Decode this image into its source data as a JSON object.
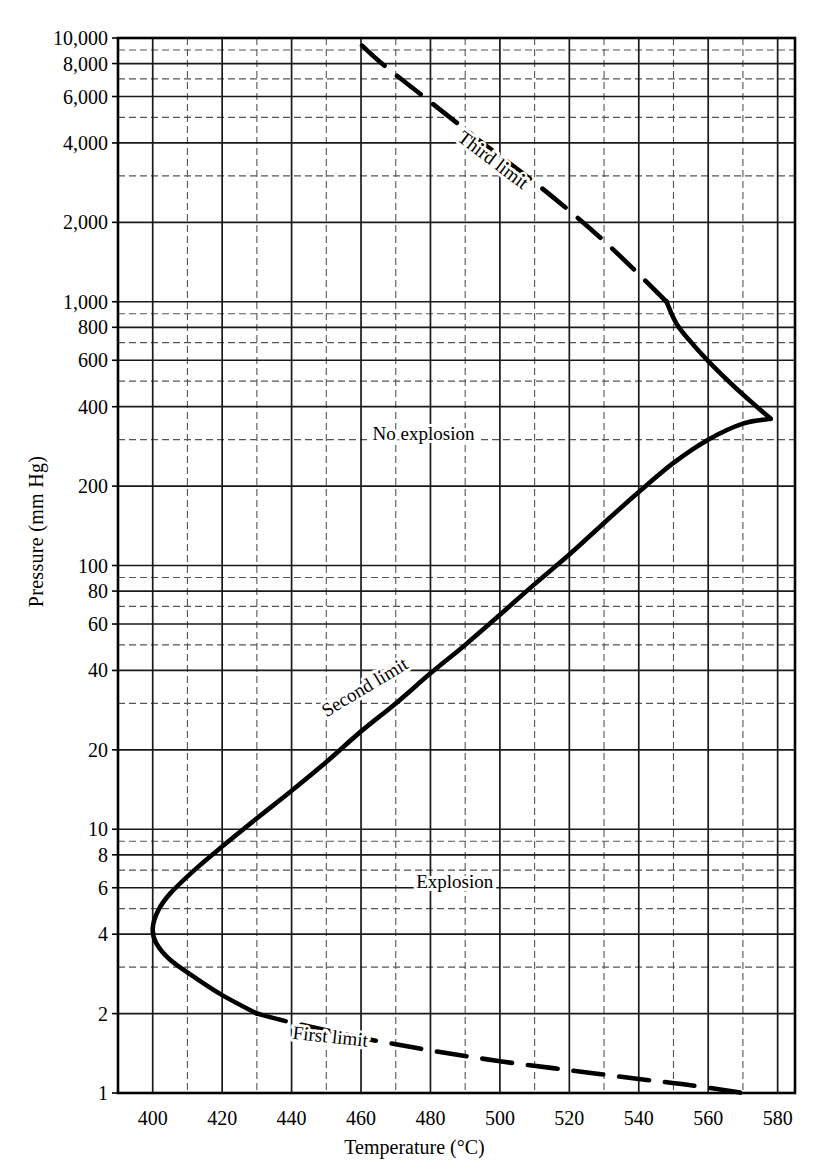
{
  "chart_data": {
    "type": "line",
    "title": "",
    "xlabel": "Temperature (°C)",
    "ylabel": "Pressure (mm Hg)",
    "xlim": [
      390,
      585
    ],
    "ylim": [
      1,
      10000
    ],
    "yscale": "log",
    "xscale": "linear",
    "grid": true,
    "legend": "none",
    "x_ticks": [
      400,
      420,
      440,
      460,
      480,
      500,
      520,
      540,
      560,
      580
    ],
    "x_tick_labels": [
      "400",
      "420",
      "440",
      "460",
      "480",
      "500",
      "520",
      "540",
      "560",
      "580"
    ],
    "x_minor_ticks": [
      410,
      430,
      450,
      470,
      490,
      510,
      530,
      550,
      570
    ],
    "y_ticks": [
      1,
      2,
      4,
      6,
      8,
      10,
      20,
      40,
      60,
      80,
      100,
      200,
      400,
      600,
      800,
      1000,
      2000,
      4000,
      6000,
      8000,
      10000
    ],
    "y_tick_labels": [
      "1",
      "2",
      "4",
      "6",
      "8",
      "10",
      "20",
      "40",
      "60",
      "80",
      "100",
      "200",
      "400",
      "600",
      "800",
      "1,000",
      "2,000",
      "4,000",
      "6,000",
      "8,000",
      "10,000"
    ],
    "y_minor_ticks": [
      3,
      5,
      7,
      9,
      30,
      50,
      70,
      90,
      300,
      500,
      700,
      900,
      3000,
      5000,
      7000,
      9000
    ],
    "series": [
      {
        "name": "First limit",
        "style": "dashed",
        "label": "First limit",
        "points": [
          [
            430.0,
            2.0
          ],
          [
            440.0,
            1.85
          ],
          [
            460.0,
            1.62
          ],
          [
            480.0,
            1.45
          ],
          [
            500.0,
            1.32
          ],
          [
            520.0,
            1.22
          ],
          [
            540.0,
            1.13
          ],
          [
            555.0,
            1.07
          ],
          [
            570.0,
            1.0
          ]
        ]
      },
      {
        "name": "Second limit",
        "style": "solid",
        "label": "Second limit",
        "points": [
          [
            430.0,
            2.0
          ],
          [
            420.0,
            2.35
          ],
          [
            412.0,
            2.75
          ],
          [
            405.0,
            3.2
          ],
          [
            401.0,
            3.7
          ],
          [
            400.0,
            4.2
          ],
          [
            401.5,
            4.9
          ],
          [
            405.0,
            5.7
          ],
          [
            412.0,
            7.0
          ],
          [
            420.0,
            8.6
          ],
          [
            430.0,
            11.0
          ],
          [
            440.0,
            14.0
          ],
          [
            450.0,
            18.0
          ],
          [
            460.0,
            23.5
          ],
          [
            470.0,
            30.0
          ],
          [
            480.0,
            39.0
          ],
          [
            490.0,
            50.0
          ],
          [
            500.0,
            65.0
          ],
          [
            510.0,
            85.0
          ],
          [
            520.0,
            110.0
          ],
          [
            530.0,
            145.0
          ],
          [
            540.0,
            190.0
          ],
          [
            550.0,
            245.0
          ],
          [
            560.0,
            300.0
          ],
          [
            570.0,
            345.0
          ],
          [
            578.0,
            360.0
          ]
        ]
      },
      {
        "name": "Third limit (solid portion)",
        "style": "solid",
        "label": "",
        "points": [
          [
            578.0,
            360.0
          ],
          [
            574.0,
            400.0
          ],
          [
            568.0,
            470.0
          ],
          [
            562.0,
            560.0
          ],
          [
            556.0,
            680.0
          ],
          [
            551.0,
            820.0
          ],
          [
            548.0,
            1000.0
          ]
        ]
      },
      {
        "name": "Third limit",
        "style": "dashed",
        "label": "Third limit",
        "points": [
          [
            548.0,
            1000.0
          ],
          [
            530.0,
            1700.0
          ],
          [
            512.0,
            2700.0
          ],
          [
            495.0,
            4000.0
          ],
          [
            478.0,
            6000.0
          ],
          [
            466.0,
            8000.0
          ],
          [
            458.0,
            10000.0
          ]
        ]
      }
    ],
    "annotations": [
      {
        "text": "No explosion",
        "x": 478,
        "y": 300,
        "rotation": 0,
        "name": "no-explosion-label"
      },
      {
        "text": "Explosion",
        "x": 487,
        "y": 6.0,
        "rotation": 0,
        "name": "explosion-label"
      },
      {
        "text": "Third limit",
        "x": 497,
        "y": 3300,
        "rotation": 37,
        "name": "third-limit-label"
      },
      {
        "text": "Second limit",
        "x": 462,
        "y": 33,
        "rotation": -31,
        "name": "second-limit-label"
      },
      {
        "text": "First limit",
        "x": 451,
        "y": 1.55,
        "rotation": 6,
        "name": "first-limit-label"
      }
    ]
  },
  "axes": {
    "x_title": "Temperature (°C)",
    "y_title": "Pressure (mm Hg)"
  },
  "colors": {
    "curve": "#000000",
    "grid_major": "#1a1a1a",
    "grid_minor": "#555555",
    "background": "#ffffff",
    "text": "#000000"
  }
}
